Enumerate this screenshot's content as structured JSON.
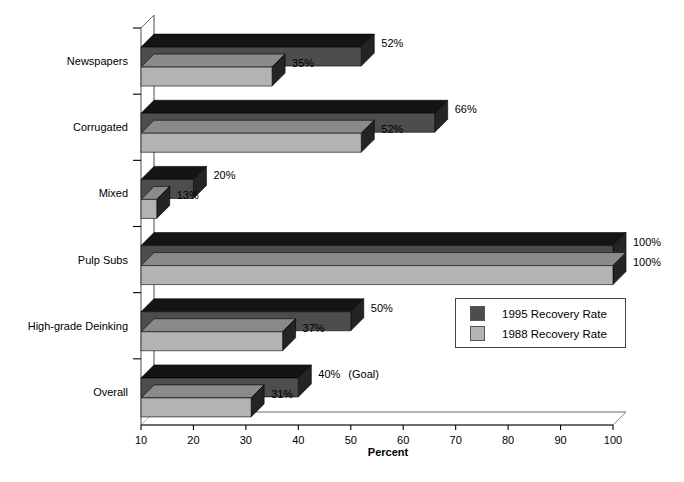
{
  "chart_data": {
    "type": "bar",
    "orientation": "horizontal",
    "title": "",
    "subtitle": "",
    "xlabel": "Percent",
    "ylabel": "",
    "xlim": [
      10,
      100
    ],
    "xticks": [
      10,
      20,
      30,
      40,
      50,
      60,
      70,
      80,
      90,
      100
    ],
    "xtick_labels": [
      "10",
      "20",
      "30",
      "40",
      "50",
      "60",
      "70",
      "80",
      "90",
      "100"
    ],
    "grid": false,
    "legend_position": "center-right",
    "categories": [
      "Newspapers",
      "Corrugated",
      "Mixed",
      "Pulp Subs",
      "High-grade Deinking",
      "Overall"
    ],
    "series": [
      {
        "name": "1995 Recovery Rate",
        "color": "#4d4d4d",
        "top_color": "#141414",
        "side_color": "#242424",
        "values": [
          52,
          66,
          20,
          100,
          50,
          40
        ],
        "labels": [
          "52%",
          "66%",
          "20%",
          "100%",
          "50%",
          "40%"
        ]
      },
      {
        "name": "1988 Recovery Rate",
        "color": "#b3b3b3",
        "top_color": "#8a8a8a",
        "side_color": "#242424",
        "values": [
          35,
          52,
          13,
          100,
          37,
          31
        ],
        "labels": [
          "35%",
          "52%",
          "13%",
          "100%",
          "37%",
          "31%"
        ]
      }
    ],
    "annotations": [
      {
        "text": "(Goal)",
        "attached_to": "Overall",
        "series": "1995 Recovery Rate"
      }
    ]
  },
  "legend": {
    "entries": [
      {
        "label": "1995 Recovery Rate",
        "color": "#4d4d4d"
      },
      {
        "label": "1988 Recovery Rate",
        "color": "#b3b3b3"
      }
    ]
  },
  "axis": {
    "x_title": "Percent"
  }
}
